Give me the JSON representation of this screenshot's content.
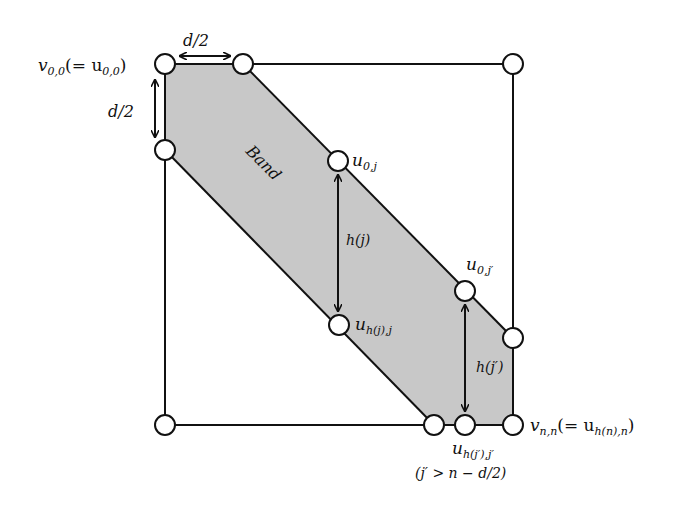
{
  "colors": {
    "band_fill": "#c8c8c8",
    "stroke": "#111111",
    "node_fill": "#ffffff",
    "background": "#ffffff"
  },
  "labels": {
    "v00": "v",
    "v00_sub": "0,0",
    "v00_eq": "(= u",
    "v00_eq_sub": "0,0",
    "v00_close": ")",
    "d2_top": "d/2",
    "d2_left": "d/2",
    "band": "Band",
    "u0j": "u",
    "u0j_sub": "0,j",
    "hj": "h(j)",
    "uhjj": "u",
    "uhjj_sub": "h(j),j",
    "u0jp": "u",
    "u0jp_sub": "0,j′",
    "hjp": "h(j′)",
    "uhjpjp": "u",
    "uhjpjp_sub": "h(j′),j′",
    "cond": "(j′ > n − d/2)",
    "vnn": "v",
    "vnn_sub": "n,n",
    "vnn_eq": "(= u",
    "vnn_eq_sub": "h(n),n",
    "vnn_close": ")"
  }
}
